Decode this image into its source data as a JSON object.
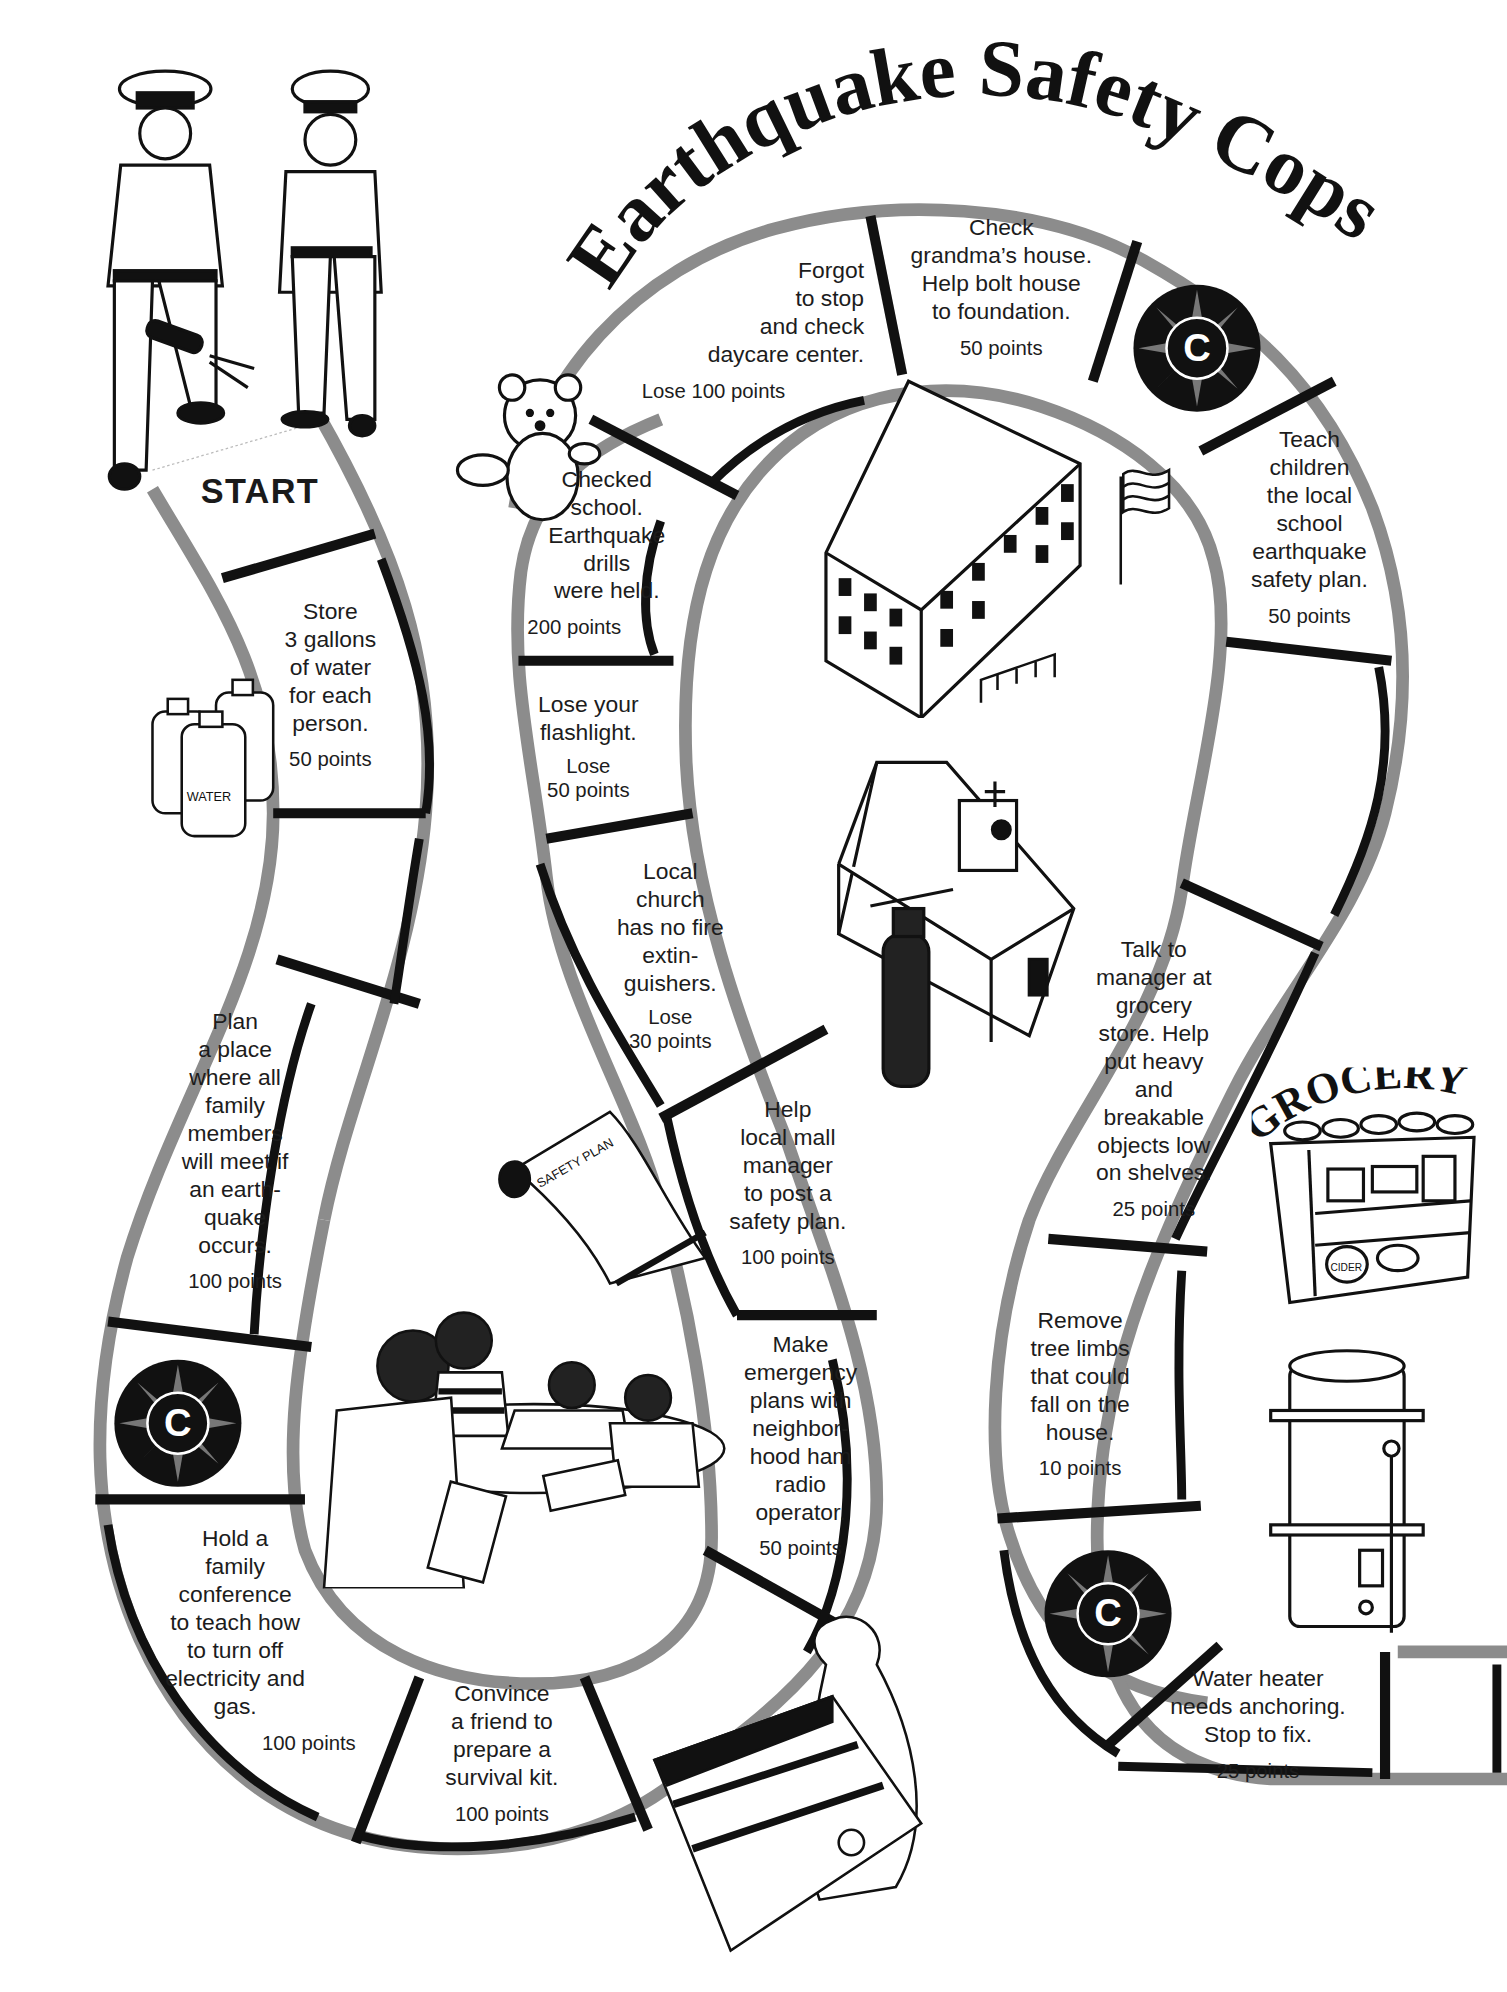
{
  "title": "Earthquake Safety Cops",
  "start_label": "START",
  "badge_letter": "C",
  "grocery_sign": "GROCERY",
  "water_label": "WATER",
  "cider_label": "CIDER",
  "safety_plan_label": "SAFETY PLAN",
  "spaces": [
    {
      "id": "store-water",
      "text": "Store\n3 gallons\nof water\nfor each\nperson.",
      "points": "50 points"
    },
    {
      "id": "blank-1",
      "text": "",
      "points": ""
    },
    {
      "id": "plan-meeting-place",
      "text": "Plan\na  place\nwhere all\nfamily\nmembers\nwill meet if\nan earth-\nquake\noccurs.",
      "points": "100 points"
    },
    {
      "id": "cops-badge-1",
      "text": "",
      "points": ""
    },
    {
      "id": "family-conference",
      "text": "Hold a\nfamily\nconference\nto teach how\nto turn off\nelectricity and\ngas.",
      "points": "100 points"
    },
    {
      "id": "survival-kit",
      "text": "Convince\na friend to\nprepare a\nsurvival kit.",
      "points": "100 points"
    },
    {
      "id": "blank-2",
      "text": "",
      "points": ""
    },
    {
      "id": "ham-radio",
      "text": "Make\nemergency\nplans with\nneighbor-\nhood ham\nradio\noperator.",
      "points": "50 points"
    },
    {
      "id": "mall-safety-plan",
      "text": "Help\nlocal mall\nmanager\nto post a\nsafety plan.",
      "points": "100 points"
    },
    {
      "id": "church-extinguishers",
      "text": "Local\nchurch\nhas no fire\nextin-\nguishers.",
      "points": "Lose\n30 points"
    },
    {
      "id": "lose-flashlight",
      "text": "Lose your\nflashlight.",
      "points": "Lose\n50 points"
    },
    {
      "id": "checked-school",
      "text": "Checked\nschool.\nEarthquake\ndrills\nwere held.",
      "points": "200 points"
    },
    {
      "id": "forgot-daycare",
      "text": "Forgot\nto stop\nand check\ndaycare center.",
      "points": "Lose 100 points"
    },
    {
      "id": "grandmas-house",
      "text": "Check\ngrandma’s house.\nHelp bolt house\nto foundation.",
      "points": "50 points"
    },
    {
      "id": "cops-badge-2",
      "text": "",
      "points": ""
    },
    {
      "id": "school-safety-plan",
      "text": "Teach\nchildren\nthe local\nschool\nearthquake\nsafety plan.",
      "points": "50 points"
    },
    {
      "id": "blank-3",
      "text": "",
      "points": ""
    },
    {
      "id": "grocery-manager",
      "text": "Talk to\nmanager at\ngrocery\nstore. Help\nput heavy\nand\nbreakable\nobjects low\non shelves.",
      "points": "25 points"
    },
    {
      "id": "tree-limbs",
      "text": "Remove\ntree limbs\nthat could\nfall on the\nhouse.",
      "points": "10 points"
    },
    {
      "id": "cops-badge-3",
      "text": "",
      "points": ""
    },
    {
      "id": "water-heater",
      "text": "Water heater\nneeds anchoring.\nStop to fix.",
      "points": "25 points"
    },
    {
      "id": "finish-blank",
      "text": "",
      "points": ""
    }
  ],
  "colors": {
    "track_outer": "#8c8c8c",
    "track_inner": "#111111",
    "space_fill": "#ffffff",
    "ink": "#1a1a1a"
  }
}
